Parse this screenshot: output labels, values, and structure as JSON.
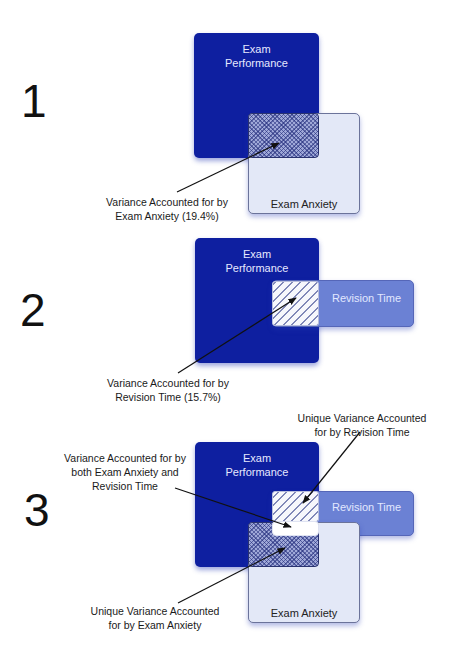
{
  "panels": [
    {
      "number": "1",
      "boxes": {
        "performance": [
          "Exam",
          "Performance"
        ],
        "anxiety": "Exam Anxiety"
      },
      "caption": [
        "Variance Accounted for by",
        "Exam Anxiety (19.4%)"
      ]
    },
    {
      "number": "2",
      "boxes": {
        "performance": [
          "Exam",
          "Performance"
        ],
        "revision": "Revision Time"
      },
      "caption": [
        "Variance Accounted for by",
        "Revision Time (15.7%)"
      ]
    },
    {
      "number": "3",
      "boxes": {
        "performance": [
          "Exam",
          "Performance"
        ],
        "revision": "Revision Time",
        "anxiety": "Exam Anxiety"
      },
      "captions": {
        "unique_revision": [
          "Unique Variance Accounted",
          "for by Revision Time"
        ],
        "shared": [
          "Variance Accounted for by",
          "both Exam Anxiety and",
          "Revision Time"
        ],
        "unique_anxiety": [
          "Unique Variance Accounted",
          "for by Exam Anxiety"
        ]
      }
    }
  ],
  "colors": {
    "exam_performance": "#0e1fa0",
    "exam_anxiety": "#e3e8f7",
    "revision_time": "#6b81d4",
    "arrow": "#111111"
  }
}
